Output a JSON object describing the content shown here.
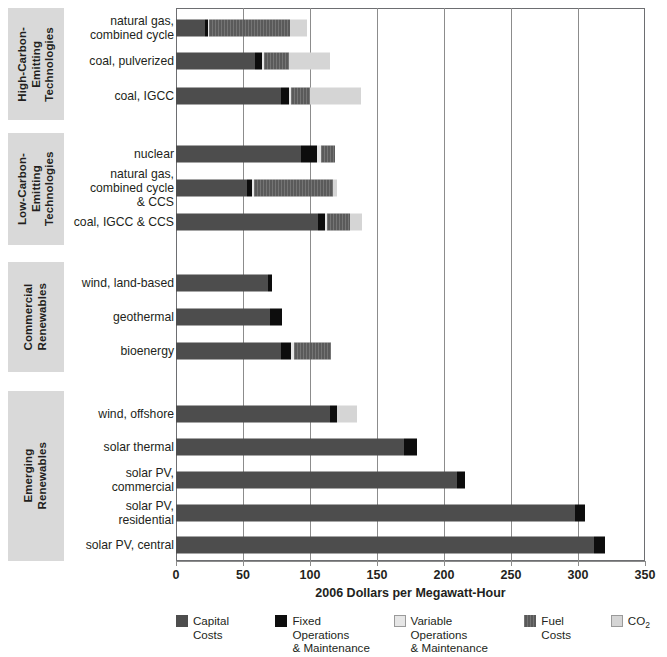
{
  "chart_data": {
    "type": "bar",
    "orientation": "horizontal",
    "stacked": true,
    "title": "",
    "xlabel": "2006 Dollars per Megawatt-Hour",
    "ylabel": "",
    "xlim": [
      0,
      350
    ],
    "xticks": [
      0,
      50,
      100,
      150,
      200,
      250,
      300,
      350
    ],
    "xticklabels": [
      "0",
      "50",
      "100",
      "150",
      "200",
      "250",
      "300",
      "350"
    ],
    "grid": "vertical",
    "legend_position": "bottom",
    "series": [
      {
        "name": "Capital Costs",
        "key": "capital",
        "color": "#4d4d4d"
      },
      {
        "name": "Fixed Operations & Maintenance",
        "key": "fom",
        "color": "#0d0d0d"
      },
      {
        "name": "Variable Operations & Maintenance",
        "key": "vom",
        "color": "#e6e6e6"
      },
      {
        "name": "Fuel Costs",
        "key": "fuel",
        "color": "#5a5a5a"
      },
      {
        "name": "CO2",
        "key": "co2",
        "color": "#d5d5d5"
      }
    ],
    "groups": [
      {
        "label": "High-Carbon-\nEmitting\nTechnologies",
        "categories": [
          {
            "label": "natural gas,\ncombined cycle",
            "capital": 22,
            "fom": 2,
            "vom": 1,
            "fuel": 60,
            "co2": 13,
            "total": 98
          },
          {
            "label": "coal, pulverized",
            "capital": 59,
            "fom": 5,
            "vom": 2,
            "fuel": 18,
            "co2": 31,
            "total": 115
          },
          {
            "label": "coal, IGCC",
            "capital": 78,
            "fom": 6,
            "vom": 2,
            "fuel": 14,
            "co2": 38,
            "total": 138
          }
        ]
      },
      {
        "label": "Low-Carbon-Emitting\nTechnologies",
        "categories": [
          {
            "label": "nuclear",
            "capital": 93,
            "fom": 12,
            "vom": 3,
            "fuel": 11,
            "co2": 0,
            "total": 119
          },
          {
            "label": "natural gas,\ncombined cycle\n& CCS",
            "capital": 53,
            "fom": 4,
            "vom": 1,
            "fuel": 59,
            "co2": 3,
            "total": 120
          },
          {
            "label": "coal, IGCC & CCS",
            "capital": 106,
            "fom": 5,
            "vom": 2,
            "fuel": 17,
            "co2": 9,
            "total": 139
          }
        ]
      },
      {
        "label": "Commercial\nRenewables",
        "categories": [
          {
            "label": "wind, land-based",
            "capital": 69,
            "fom": 3,
            "vom": 0,
            "fuel": 0,
            "co2": 0,
            "total": 72
          },
          {
            "label": "geothermal",
            "capital": 70,
            "fom": 9,
            "vom": 0,
            "fuel": 0,
            "co2": 0,
            "total": 79
          },
          {
            "label": "bioenergy",
            "capital": 78,
            "fom": 8,
            "vom": 2,
            "fuel": 28,
            "co2": 0,
            "total": 116
          }
        ]
      },
      {
        "label": "Emerging\nRenewables",
        "categories": [
          {
            "label": "wind, offshore",
            "capital": 115,
            "fom": 5,
            "vom": 0,
            "fuel": 0,
            "co2": 15,
            "total": 135
          },
          {
            "label": "solar thermal",
            "capital": 170,
            "fom": 10,
            "vom": 0,
            "fuel": 0,
            "co2": 0,
            "total": 180
          },
          {
            "label": "solar PV,\ncommercial",
            "capital": 210,
            "fom": 6,
            "vom": 0,
            "fuel": 0,
            "co2": 0,
            "total": 216
          },
          {
            "label": "solar PV,\nresidential",
            "capital": 298,
            "fom": 7,
            "vom": 0,
            "fuel": 0,
            "co2": 0,
            "total": 305
          },
          {
            "label": "solar PV, central",
            "capital": 312,
            "fom": 8,
            "vom": 0,
            "fuel": 0,
            "co2": 0,
            "total": 320
          }
        ]
      }
    ],
    "legend": [
      {
        "label": "Capital Costs",
        "swatch": "capital"
      },
      {
        "label": "Fixed Operations\n& Maintenance",
        "swatch": "fom"
      },
      {
        "label": "Variable Operations\n& Maintenance",
        "swatch": "vom"
      },
      {
        "label": "Fuel Costs",
        "swatch": "fuel"
      },
      {
        "label": "CO2",
        "swatch": "co2"
      }
    ]
  }
}
